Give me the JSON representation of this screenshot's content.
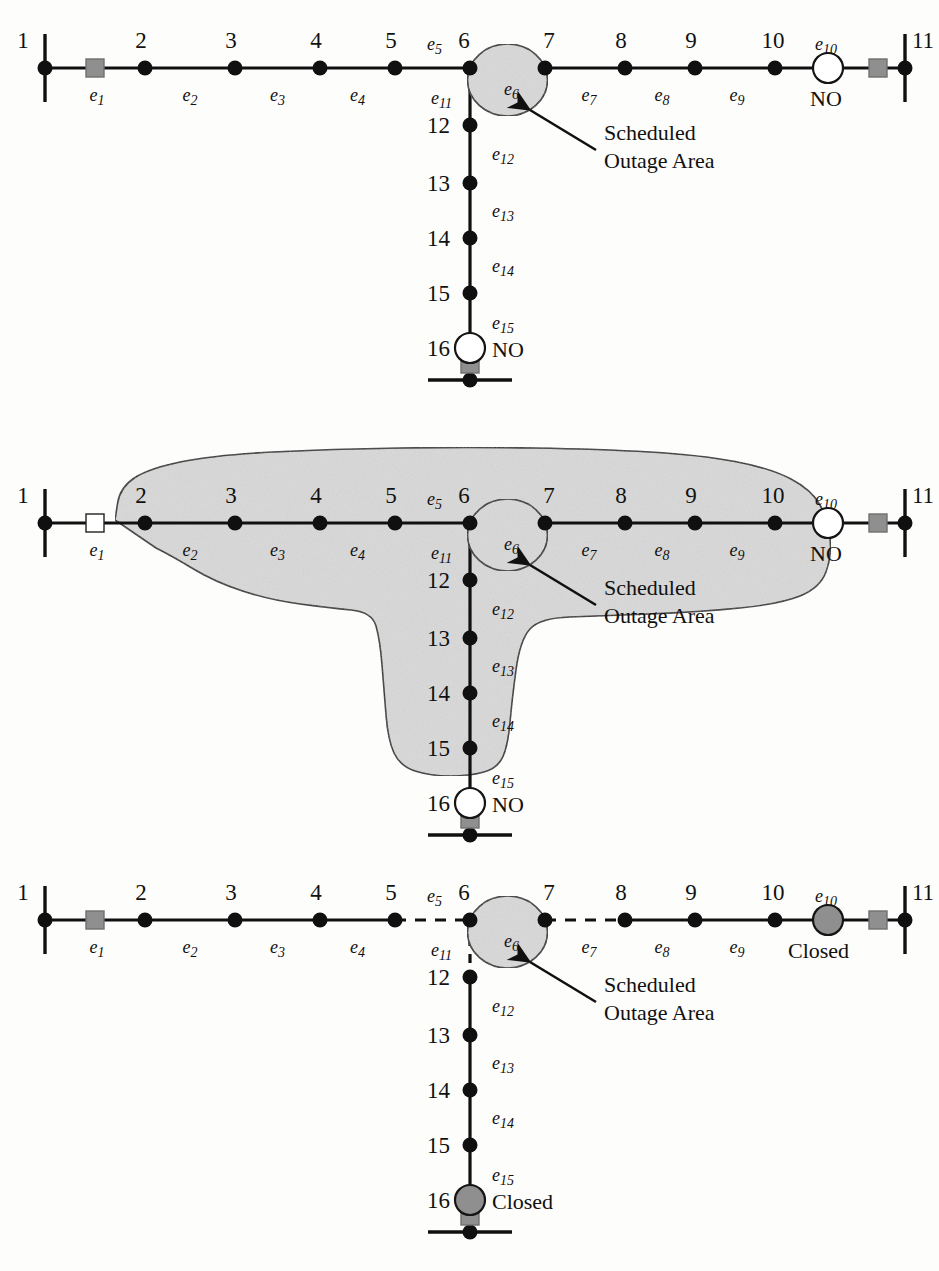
{
  "figure": {
    "annotation_text_line1": "Scheduled",
    "annotation_text_line2": "Outage Area",
    "state_no": "NO",
    "state_closed": "Closed",
    "colors": {
      "line": "#101010",
      "node_fill": "#101010",
      "switch_closed_fill": "#8f8f8f",
      "switch_open_fill": "#ffffff",
      "outage_fill": "#d9d9d9",
      "outage_stroke": "#2b2b2b",
      "background": "#fdfdfc"
    }
  },
  "nodes": {
    "main": [
      "1",
      "2",
      "3",
      "4",
      "5",
      "6",
      "7",
      "8",
      "9",
      "10",
      "11"
    ],
    "branch": [
      "12",
      "13",
      "14",
      "15",
      "16"
    ]
  },
  "edges": {
    "main": [
      "e1",
      "e2",
      "e3",
      "e4",
      "e5",
      "e6",
      "e7",
      "e8",
      "e9",
      "e10"
    ],
    "branch": [
      "e11",
      "e12",
      "e13",
      "e14",
      "e15"
    ]
  },
  "edge_labels": {
    "e1": {
      "base": "e",
      "sub": "1"
    },
    "e2": {
      "base": "e",
      "sub": "2"
    },
    "e3": {
      "base": "e",
      "sub": "3"
    },
    "e4": {
      "base": "e",
      "sub": "4"
    },
    "e5": {
      "base": "e",
      "sub": "5"
    },
    "e6": {
      "base": "e",
      "sub": "6"
    },
    "e7": {
      "base": "e",
      "sub": "7"
    },
    "e8": {
      "base": "e",
      "sub": "8"
    },
    "e9": {
      "base": "e",
      "sub": "9"
    },
    "e10": {
      "base": "e",
      "sub": "10"
    },
    "e11": {
      "base": "e",
      "sub": "11"
    },
    "e12": {
      "base": "e",
      "sub": "12"
    },
    "e13": {
      "base": "e",
      "sub": "13"
    },
    "e14": {
      "base": "e",
      "sub": "14"
    },
    "e15": {
      "base": "e",
      "sub": "15"
    }
  },
  "panels": [
    {
      "id": "panel-a",
      "caption": "Pre-outage normal configuration",
      "tie_switch_e10_state": "NO",
      "tie_switch_node16_state": "NO",
      "e1_switch": "closed",
      "e5_style": "solid",
      "e7_style": "solid",
      "e11_style": "solid",
      "outage_region": "small",
      "outage_small_label": "e6"
    },
    {
      "id": "panel-b",
      "caption": "Outage area extended over feeder section",
      "tie_switch_e10_state": "NO",
      "tie_switch_node16_state": "NO",
      "e1_switch": "open",
      "e5_style": "solid",
      "e7_style": "solid",
      "e11_style": "solid",
      "outage_region": "large",
      "outage_small_label": "e6"
    },
    {
      "id": "panel-c",
      "caption": "Post-switching restored configuration",
      "tie_switch_e10_state": "Closed",
      "tie_switch_node16_state": "Closed",
      "e1_switch": "closed",
      "e5_style": "dashed",
      "e7_style": "dashed",
      "e11_style": "dashed",
      "outage_region": "small",
      "outage_small_label": "e6"
    }
  ],
  "geometry": {
    "main_x": [
      45,
      145,
      235,
      320,
      395,
      470,
      545,
      625,
      695,
      775,
      905
    ],
    "switch_e1_x": 95,
    "switch_e10_x": 828,
    "switch_right_sq_x": 878,
    "branch_x": 470,
    "branch_dy": [
      57,
      115,
      170,
      225,
      280
    ],
    "branch_sq_dy": 296,
    "branch_bus_dy": 312,
    "rows": [
      68,
      523,
      920
    ]
  }
}
